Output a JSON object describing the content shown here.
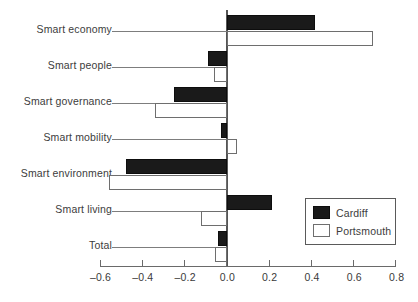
{
  "chart_data": {
    "type": "bar",
    "orientation": "horizontal",
    "title": "",
    "subtitle": "",
    "xlabel": "",
    "ylabel": "",
    "categories": [
      "Smart economy",
      "Smart people",
      "Smart governance",
      "Smart mobility",
      "Smart environment",
      "Smart living",
      "Total"
    ],
    "series": [
      {
        "name": "Cardiff",
        "color": "#1a1a1a",
        "fill": "solid-black",
        "values": [
          0.42,
          -0.09,
          -0.25,
          -0.025,
          -0.475,
          0.215,
          -0.04
        ]
      },
      {
        "name": "Portsmouth",
        "color": "#ffffff",
        "fill": "white-outlined",
        "values": [
          0.69,
          -0.06,
          -0.34,
          0.05,
          -0.555,
          -0.12,
          -0.055
        ]
      }
    ],
    "xlim": [
      -0.6,
      0.8
    ],
    "xticks": [
      -0.6,
      -0.4,
      -0.2,
      0.0,
      0.2,
      0.4,
      0.6,
      0.8
    ],
    "xticklabels": [
      "–0.6",
      "–0.4",
      "–0.2",
      "0.0",
      "0.2",
      "0.4",
      "0.6",
      "0.8"
    ],
    "grid": false,
    "zero_reference_line": true,
    "legend": {
      "position": "bottom-right",
      "entries": [
        {
          "label": "Cardiff",
          "swatch": "black"
        },
        {
          "label": "Portsmouth",
          "swatch": "white"
        }
      ]
    }
  }
}
